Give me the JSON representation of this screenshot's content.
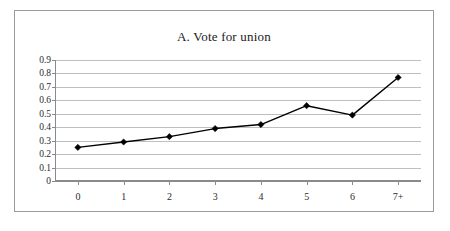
{
  "figure": {
    "title": "A. Vote for union",
    "border_color": "#9a9a9a",
    "background": "#ffffff"
  },
  "chart_data": {
    "type": "line",
    "title": "A. Vote for union",
    "xlabel": "",
    "ylabel": "",
    "categories": [
      "0",
      "1",
      "2",
      "3",
      "4",
      "5",
      "6",
      "7+"
    ],
    "values": [
      0.25,
      0.29,
      0.33,
      0.39,
      0.42,
      0.56,
      0.49,
      0.77
    ],
    "series": [
      {
        "name": "Vote for union",
        "values": [
          0.25,
          0.29,
          0.33,
          0.39,
          0.42,
          0.56,
          0.49,
          0.77
        ]
      }
    ],
    "ylim": [
      0,
      0.9
    ],
    "ytick_labels": [
      "0.9",
      "0.8",
      "0.7",
      "0.6",
      "0.5",
      "0.4",
      "0.3",
      "0.2",
      "0.1",
      "0"
    ],
    "ytick_values": [
      0.9,
      0.8,
      0.7,
      0.6,
      0.5,
      0.4,
      0.3,
      0.2,
      0.1,
      0
    ],
    "grid": true,
    "grid_color": "#bfbfbf",
    "legend": false,
    "legend_position": "none",
    "line_color": "#000000",
    "marker": "diamond",
    "marker_color": "#000000",
    "axis_color": "#8a8a8a"
  }
}
